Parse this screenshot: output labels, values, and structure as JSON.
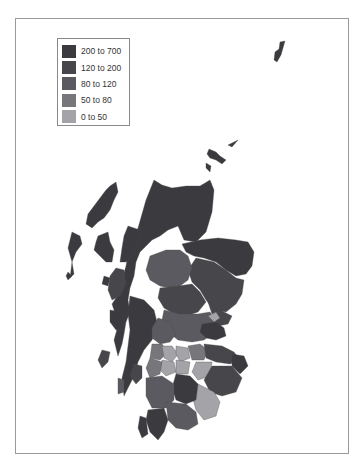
{
  "legend": {
    "items": [
      {
        "label": "200 to 700",
        "color": "#3a3a3f"
      },
      {
        "label": "120 to 200",
        "color": "#46464b"
      },
      {
        "label": "80 to 120",
        "color": "#5a5a60"
      },
      {
        "label": "50 to 80",
        "color": "#76767b"
      },
      {
        "label": "0 to 50",
        "color": "#a4a4a8"
      }
    ]
  },
  "map": {
    "region": "Scotland",
    "type": "choropleth",
    "classes": [
      "200 to 700",
      "120 to 200",
      "80 to 120",
      "50 to 80",
      "0 to 50"
    ]
  }
}
